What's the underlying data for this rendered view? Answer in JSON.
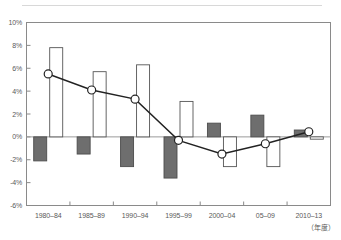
{
  "figure": {
    "top_rule": "horizontal-rule",
    "xaxis_title": "（年度）"
  },
  "chart_data": {
    "type": "bar",
    "title": "",
    "subtitle": "",
    "xlabel": "（年度）",
    "ylabel": "",
    "categories": [
      "1980–84",
      "1985–89",
      "1990–94",
      "1995–99",
      "2000–04",
      "05–09",
      "2010–13"
    ],
    "ylim": [
      -6,
      10
    ],
    "ytick_values": [
      10,
      8,
      6,
      4,
      2,
      0,
      -2,
      -4,
      -6
    ],
    "ytick_labels": [
      "10%",
      "8%",
      "6%",
      "4%",
      "2%",
      "0%",
      "-2%",
      "-4%",
      "-6%"
    ],
    "grid": false,
    "legend": "none",
    "zero_line": true,
    "series": [
      {
        "name": "dark-bar-series",
        "kind": "bar",
        "style": "filled",
        "color": "#6e6e6e",
        "edge_color": "#4d4d4d",
        "values": [
          -2.1,
          -1.5,
          -2.6,
          -3.6,
          1.2,
          1.9,
          0.6
        ]
      },
      {
        "name": "white-bar-series",
        "kind": "bar",
        "style": "outline",
        "color": "#ffffff",
        "edge_color": "#555555",
        "values": [
          7.8,
          5.7,
          6.3,
          3.1,
          -2.6,
          -2.6,
          -0.2
        ]
      },
      {
        "name": "line-marker-series",
        "kind": "line",
        "color": "#222222",
        "marker": "open-circle",
        "marker_face": "#ffffff",
        "values": [
          5.5,
          4.1,
          3.3,
          -0.3,
          -1.5,
          -0.6,
          0.45
        ]
      }
    ]
  }
}
